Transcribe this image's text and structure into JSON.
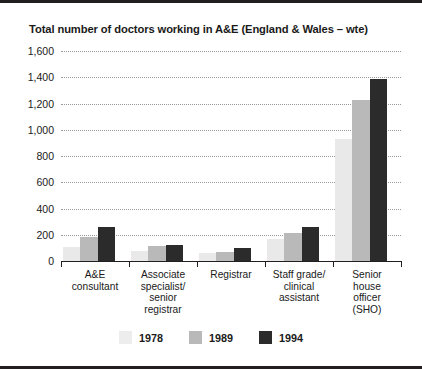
{
  "chart_data": {
    "type": "bar",
    "title": "Total number of doctors working in A&E (England & Wales – wte)",
    "xlabel": "",
    "ylabel": "",
    "ylim": [
      0,
      1600
    ],
    "yticks": [
      0,
      200,
      400,
      600,
      800,
      1000,
      1200,
      1400,
      1600
    ],
    "ytick_labels": [
      "0",
      "200",
      "400",
      "600",
      "800",
      "1,000",
      "1,200",
      "1,400",
      "1,600"
    ],
    "grid": true,
    "legend_position": "bottom",
    "categories": [
      "A&E\nconsultant",
      "Associate\nspecialist/\nsenior\nregistrar",
      "Registrar",
      "Staff grade/\nclinical\nassistant",
      "Senior\nhouse\nofficer\n(SHO)"
    ],
    "series": [
      {
        "name": "1978",
        "color": "#e9e9e9",
        "values": [
          110,
          80,
          60,
          165,
          930
        ]
      },
      {
        "name": "1989",
        "color": "#b9b9b9",
        "values": [
          185,
          115,
          70,
          215,
          1230
        ]
      },
      {
        "name": "1994",
        "color": "#2b2b2b",
        "values": [
          260,
          125,
          100,
          260,
          1385
        ]
      }
    ]
  },
  "legend": {
    "items": [
      {
        "label": "1978"
      },
      {
        "label": "1989"
      },
      {
        "label": "1994"
      }
    ]
  }
}
